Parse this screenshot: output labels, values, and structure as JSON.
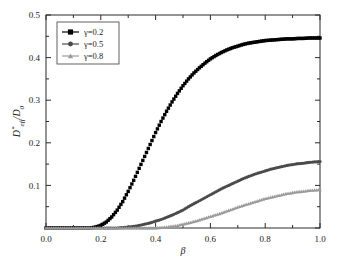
{
  "figure": {
    "title": "",
    "background": "#ffffff"
  },
  "axes": {
    "x": {
      "label": "β",
      "ticks": [
        "0.0",
        "0.2",
        "0.4",
        "0.6",
        "0.8",
        "1.0"
      ],
      "tick_values": [
        0.0,
        0.2,
        0.4,
        0.6,
        0.8,
        1.0
      ],
      "min": 0.0,
      "max": 1.0,
      "minor_ticks_per_interval": 1
    },
    "y": {
      "label": "D*eff / D0",
      "label_parts": {
        "main": "D",
        "superscript": "*",
        "subscript": "eff",
        "divider": "/",
        "denom": "D",
        "denom_sub": "0"
      },
      "ticks": [
        "0.0",
        "0.1",
        "0.2",
        "0.3",
        "0.4",
        "0.5"
      ],
      "tick_values": [
        0.0,
        0.1,
        0.2,
        0.3,
        0.4,
        0.5
      ],
      "min": 0.0,
      "max": 0.5,
      "minor_ticks_per_interval": 1,
      "zero_tick_hidden": true
    }
  },
  "legend": {
    "position": "upper-left",
    "entries": [
      {
        "label": "γ=0.2",
        "marker": "square",
        "color": "#000000"
      },
      {
        "label": "γ=0.5",
        "marker": "circle",
        "color": "#4a4a4a"
      },
      {
        "label": "γ=0.8",
        "marker": "triangle",
        "color": "#9a9a9a"
      }
    ]
  },
  "chart_data": {
    "type": "scatter",
    "title": "",
    "xlabel": "β",
    "ylabel": "D*eff/D0",
    "xlim": [
      0.0,
      1.0
    ],
    "ylim": [
      0.0,
      0.5
    ],
    "grid": false,
    "legend_position": "upper-left",
    "x": [
      0.0,
      0.02,
      0.04,
      0.06,
      0.08,
      0.1,
      0.12,
      0.14,
      0.16,
      0.18,
      0.2,
      0.22,
      0.24,
      0.26,
      0.28,
      0.3,
      0.32,
      0.34,
      0.36,
      0.38,
      0.4,
      0.42,
      0.44,
      0.46,
      0.48,
      0.5,
      0.52,
      0.54,
      0.56,
      0.58,
      0.6,
      0.62,
      0.64,
      0.66,
      0.68,
      0.7,
      0.72,
      0.74,
      0.76,
      0.78,
      0.8,
      0.82,
      0.84,
      0.86,
      0.88,
      0.9,
      0.92,
      0.94,
      0.96,
      0.98,
      1.0
    ],
    "series": [
      {
        "name": "γ=0.2",
        "marker": "square",
        "color": "#000000",
        "values": [
          0.0,
          0.0,
          0.0,
          0.0,
          0.0,
          0.0,
          0.0,
          0.0,
          0.0,
          0.002,
          0.006,
          0.014,
          0.026,
          0.042,
          0.062,
          0.086,
          0.112,
          0.14,
          0.168,
          0.196,
          0.224,
          0.25,
          0.274,
          0.296,
          0.316,
          0.334,
          0.35,
          0.364,
          0.376,
          0.387,
          0.397,
          0.405,
          0.412,
          0.418,
          0.423,
          0.427,
          0.431,
          0.434,
          0.436,
          0.438,
          0.44,
          0.441,
          0.442,
          0.443,
          0.444,
          0.444,
          0.445,
          0.445,
          0.446,
          0.446,
          0.446
        ]
      },
      {
        "name": "γ=0.5",
        "marker": "circle",
        "color": "#4a4a4a",
        "values": [
          0.0,
          0.0,
          0.0,
          0.0,
          0.0,
          0.0,
          0.0,
          0.0,
          0.0,
          0.0,
          0.0,
          0.0,
          0.0,
          0.0,
          0.001,
          0.002,
          0.004,
          0.006,
          0.009,
          0.012,
          0.016,
          0.02,
          0.025,
          0.03,
          0.036,
          0.042,
          0.05,
          0.057,
          0.064,
          0.071,
          0.078,
          0.085,
          0.092,
          0.098,
          0.104,
          0.11,
          0.116,
          0.121,
          0.126,
          0.13,
          0.134,
          0.138,
          0.141,
          0.144,
          0.147,
          0.149,
          0.151,
          0.152,
          0.154,
          0.155,
          0.156
        ]
      },
      {
        "name": "γ=0.8",
        "marker": "triangle",
        "color": "#9a9a9a",
        "values": [
          0.0,
          0.0,
          0.0,
          0.0,
          0.0,
          0.0,
          0.0,
          0.0,
          0.0,
          0.0,
          0.0,
          0.0,
          0.0,
          0.0,
          0.0,
          0.0,
          0.0,
          0.0,
          0.0,
          0.0,
          0.0,
          0.001,
          0.002,
          0.004,
          0.006,
          0.009,
          0.012,
          0.015,
          0.019,
          0.023,
          0.027,
          0.031,
          0.035,
          0.04,
          0.044,
          0.049,
          0.053,
          0.057,
          0.061,
          0.065,
          0.069,
          0.072,
          0.075,
          0.078,
          0.081,
          0.083,
          0.085,
          0.086,
          0.088,
          0.089,
          0.09
        ]
      }
    ]
  }
}
